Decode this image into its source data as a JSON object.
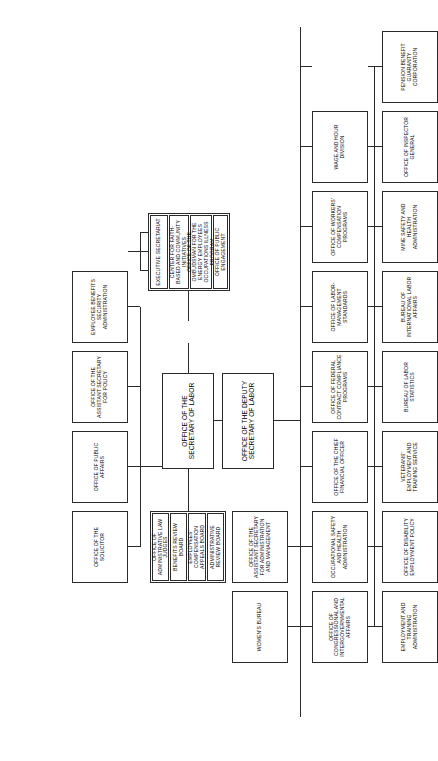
{
  "document": {
    "title": "U.S. Department of Labor Organization Chart",
    "orientation": "landscape-rotated",
    "background_color": "#ffffff",
    "line_color": "#2b2b2b"
  },
  "nodes": {
    "secretary": "OFFICE OF THE SECRETARY OF LABOR",
    "deputy_secretary": "OFFICE OF THE DEPUTY SECRETARY OF LABOR"
  },
  "boards": {
    "group_label": "adjudicatory-boards",
    "items": [
      "OFFICE OF ADMINISTRATIVE LAW JUDGES",
      "BENEFITS REVIEW BOARD",
      "EMPLOYEES' COMPENSATION APPEALS BOARD",
      "ADMINISTRATIVE REVIEW BOARD"
    ]
  },
  "secretary_staff": {
    "group_label": "secretary-staff-offices",
    "items": [
      "EXECUTIVE SECRETARIAT",
      "CENTER FOR FAITH-BASED AND COMMUNITY INITIATIVES",
      "OFFICE OF THE OMBUDSMAN FOR THE ENERGY EMPLOYEES OCCUPATIONS ILLNESS PROGRAM",
      "OFFICE OF PUBLIC ENGAGEMENT"
    ]
  },
  "row_upper": {
    "group_label": "policy-and-legal-offices",
    "items": [
      "OFFICE OF THE SOLICITOR",
      "OFFICE OF PUBLIC AFFAIRS",
      "OFFICE OF THE ASSISTANT SECRETARY FOR POLICY",
      "EMPLOYEE BENEFITS SECURITY ADMINISTRATION"
    ]
  },
  "row_middle": {
    "group_label": "program-agencies",
    "items": [
      "OFFICE OF THE CHIEF FINANCIAL OFFICER",
      "OFFICE OF FEDERAL CONTRACT COMPLIANCE PROGRAMS",
      "OFFICE OF LABOR-MANAGEMENT STANDARDS",
      "OFFICE OF WORKERS' COMPENSATION PROGRAMS",
      "WAGE AND HOUR DIVISION"
    ]
  },
  "row_lower": {
    "group_label": "administration-and-bureaus",
    "items": [
      "OFFICE OF THE ASSISTANT SECRETARY FOR ADMINISTRATION AND MANAGEMENT",
      "WOMEN'S BUREAU",
      "VETERANS' EMPLOYMENT AND TRAINING SERVICE",
      "BUREAU OF LABOR STATISTICS",
      "BUREAU OF INTERNATIONAL LABOR AFFAIRS",
      "OFFICE OF INSPECTOR GENERAL"
    ]
  },
  "row_bottom": {
    "group_label": "field-administrations",
    "items": [
      "OFFICE OF CONGRESSIONAL AND INTERGOVERNMENTAL AFFAIRS",
      "EMPLOYMENT AND TRAINING ADMINISTRATION",
      "OFFICE OF DISABILITY EMPLOYMENT POLICY",
      "OCCUPATIONAL SAFETY AND HEALTH ADMINISTRATION",
      "MINE SAFETY AND HEALTH ADMINISTRATION",
      "PENSION BENEFIT GUARANTY CORPORATION"
    ]
  }
}
